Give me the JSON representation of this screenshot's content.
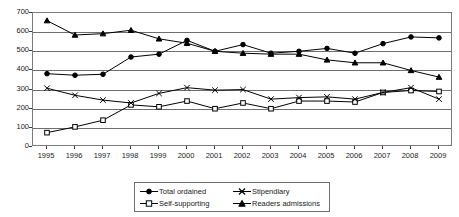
{
  "chart_data": {
    "type": "line",
    "title": "",
    "xlabel": "",
    "ylabel": "",
    "categories": [
      "1995",
      "1996",
      "1997",
      "1998",
      "1999",
      "2000",
      "2001",
      "2002",
      "2003",
      "2004",
      "2005",
      "2006",
      "2007",
      "2008",
      "2009"
    ],
    "ylim": [
      0,
      700
    ],
    "ytick_values": [
      0,
      100,
      200,
      300,
      400,
      500,
      600,
      700
    ],
    "ytick_labels": [
      "0",
      "100",
      "200",
      "300",
      "400",
      "500",
      "600",
      "700"
    ],
    "grid": true,
    "legend_position": "bottom",
    "series": [
      {
        "name": "Total ordained",
        "marker": "filled-circle",
        "values": [
          383,
          375,
          380,
          470,
          485,
          557,
          500,
          535,
          490,
          500,
          515,
          490,
          540,
          575,
          570
        ]
      },
      {
        "name": "Self-supporting",
        "marker": "open-square",
        "values": [
          75,
          105,
          140,
          220,
          210,
          240,
          200,
          230,
          200,
          240,
          240,
          235,
          285,
          295,
          290
        ]
      },
      {
        "name": "Stipendiary",
        "marker": "cross-x",
        "values": [
          307,
          270,
          245,
          230,
          280,
          310,
          297,
          300,
          250,
          258,
          262,
          250,
          285,
          310,
          250
        ]
      },
      {
        "name": "Readers admissions",
        "marker": "filled-triangle",
        "values": [
          660,
          585,
          592,
          610,
          565,
          542,
          500,
          490,
          485,
          485,
          455,
          440,
          440,
          400,
          365
        ]
      }
    ]
  },
  "legend": {
    "entries": [
      {
        "label": "Total ordained",
        "marker": "filled-circle"
      },
      {
        "label": "Stipendiary",
        "marker": "cross-x"
      },
      {
        "label": "Self-supporting",
        "marker": "open-square"
      },
      {
        "label": "Readers admissions",
        "marker": "filled-triangle"
      }
    ]
  },
  "colors": {
    "series": "#000000",
    "grid": "#6e6e6e",
    "axis": "#3c3c3c",
    "background": "#ffffff"
  }
}
